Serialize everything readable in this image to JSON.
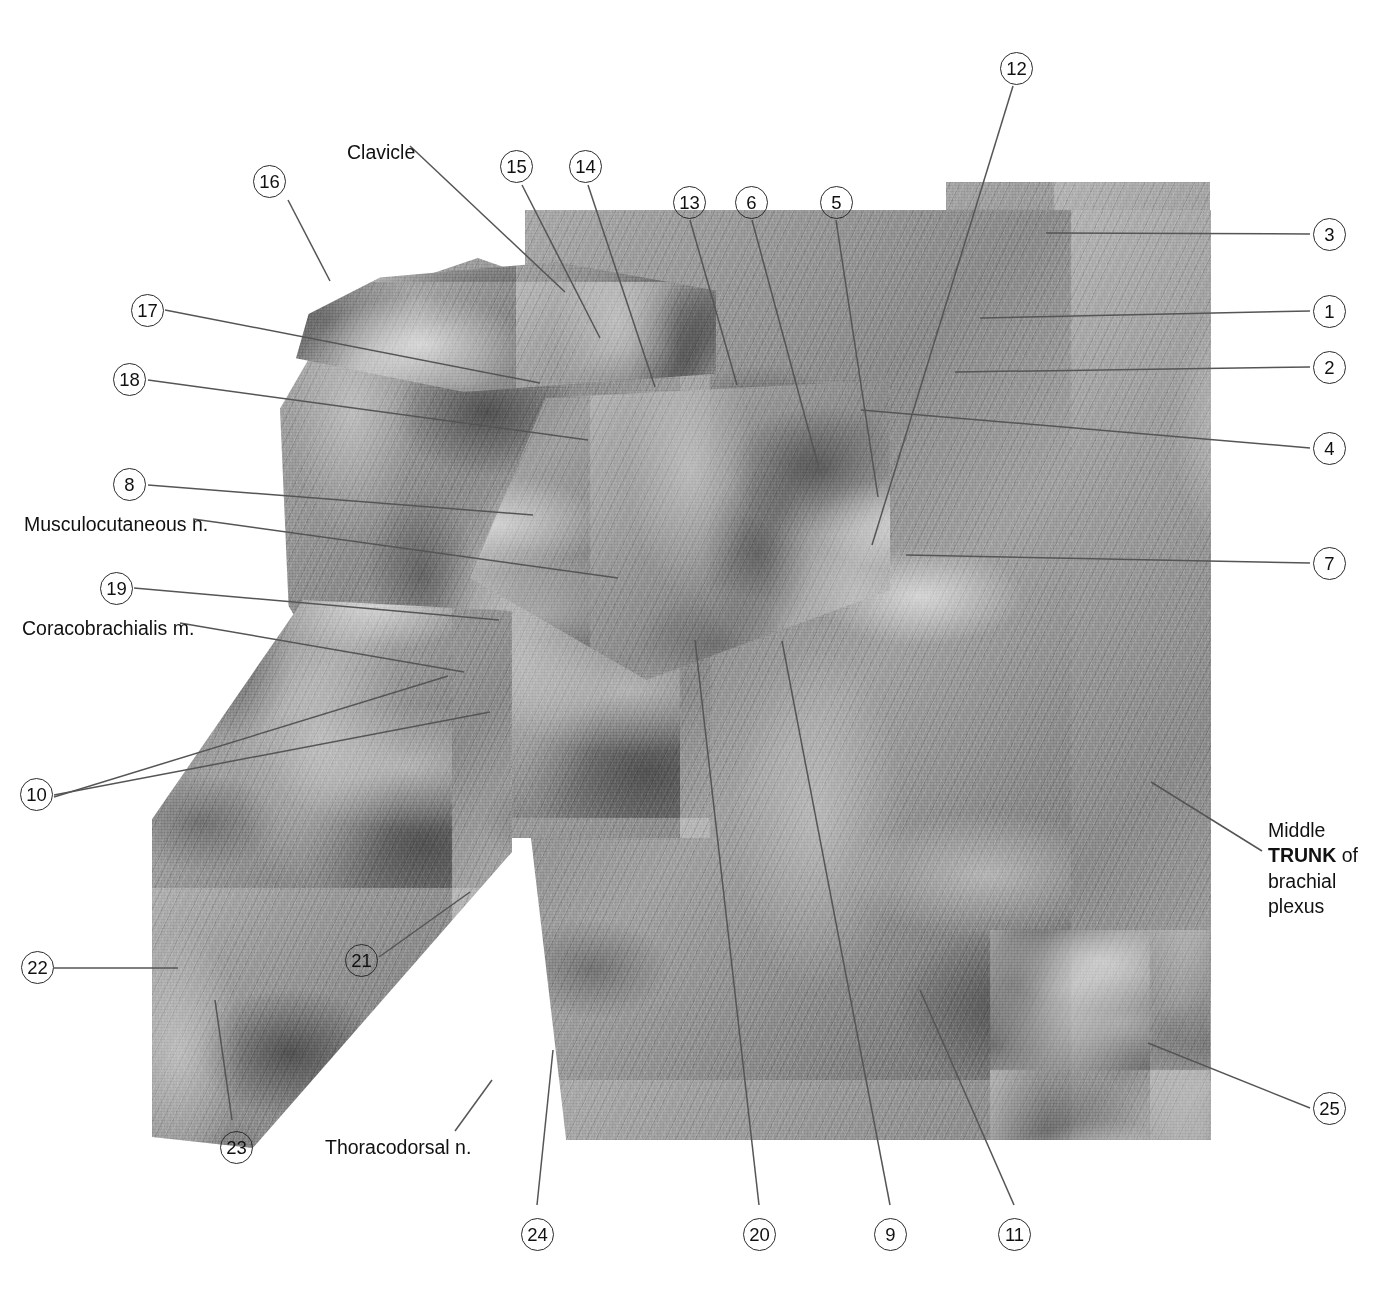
{
  "figure": {
    "type": "anatomical-photograph",
    "color_mode": "grayscale"
  },
  "text_labels": [
    {
      "id": "clavicle",
      "text": "Clavicle",
      "x": 347,
      "y": 141,
      "bold": false
    },
    {
      "id": "musculocutaneous",
      "text": "Musculocutaneous n.",
      "x": 24,
      "y": 513,
      "bold": false
    },
    {
      "id": "coracobrachialis",
      "text": "Coracobrachialis m.",
      "x": 22,
      "y": 617,
      "bold": false
    },
    {
      "id": "thoracodorsal",
      "text": "Thoracodorsal n.",
      "x": 325,
      "y": 1136,
      "bold": false
    }
  ],
  "multiline_labels": [
    {
      "id": "middle-trunk",
      "x": 1268,
      "y": 818,
      "lines": [
        {
          "text": "Middle",
          "bold": false
        },
        {
          "text": "TRUNK",
          "bold": true,
          "suffix": " of"
        },
        {
          "text": "brachial",
          "bold": false
        },
        {
          "text": "plexus",
          "bold": false
        }
      ]
    }
  ],
  "numbered_labels": [
    {
      "n": "12",
      "x": 1000,
      "y": 52,
      "group": "top"
    },
    {
      "n": "16",
      "x": 253,
      "y": 165,
      "group": "left"
    },
    {
      "n": "15",
      "x": 500,
      "y": 150,
      "group": "top"
    },
    {
      "n": "14",
      "x": 569,
      "y": 150,
      "group": "top"
    },
    {
      "n": "13",
      "x": 673,
      "y": 186,
      "group": "top"
    },
    {
      "n": "6",
      "x": 735,
      "y": 186,
      "group": "top"
    },
    {
      "n": "5",
      "x": 820,
      "y": 186,
      "group": "top"
    },
    {
      "n": "3",
      "x": 1313,
      "y": 218,
      "group": "right"
    },
    {
      "n": "1",
      "x": 1313,
      "y": 295,
      "group": "right"
    },
    {
      "n": "2",
      "x": 1313,
      "y": 351,
      "group": "right"
    },
    {
      "n": "4",
      "x": 1313,
      "y": 432,
      "group": "right"
    },
    {
      "n": "7",
      "x": 1313,
      "y": 547,
      "group": "right"
    },
    {
      "n": "17",
      "x": 131,
      "y": 294,
      "group": "left"
    },
    {
      "n": "18",
      "x": 113,
      "y": 363,
      "group": "left"
    },
    {
      "n": "8",
      "x": 113,
      "y": 468,
      "group": "left"
    },
    {
      "n": "19",
      "x": 100,
      "y": 572,
      "group": "left"
    },
    {
      "n": "10",
      "x": 20,
      "y": 778,
      "group": "left"
    },
    {
      "n": "22",
      "x": 21,
      "y": 951,
      "group": "left"
    },
    {
      "n": "23",
      "x": 220,
      "y": 1131,
      "group": "bottom"
    },
    {
      "n": "21",
      "x": 345,
      "y": 944,
      "group": "left"
    },
    {
      "n": "25",
      "x": 1313,
      "y": 1092,
      "group": "right"
    },
    {
      "n": "24",
      "x": 521,
      "y": 1218,
      "group": "bottom"
    },
    {
      "n": "20",
      "x": 743,
      "y": 1218,
      "group": "bottom"
    },
    {
      "n": "9",
      "x": 874,
      "y": 1218,
      "group": "bottom"
    },
    {
      "n": "11",
      "x": 998,
      "y": 1218,
      "group": "bottom"
    }
  ],
  "leader_lines": [
    {
      "for": "16",
      "points": "288,200 330,281"
    },
    {
      "for": "clavicle",
      "points": "410,146 565,292"
    },
    {
      "for": "15",
      "points": "522,185 600,338"
    },
    {
      "for": "14",
      "points": "588,185 655,387"
    },
    {
      "for": "13",
      "points": "690,220 737,385"
    },
    {
      "for": "6",
      "points": "752,220 818,465"
    },
    {
      "for": "5",
      "points": "836,220 878,497"
    },
    {
      "for": "12",
      "points": "1013,86 872,545"
    },
    {
      "for": "3",
      "points": "1310,234 1046,233"
    },
    {
      "for": "1",
      "points": "1310,311 980,318"
    },
    {
      "for": "2",
      "points": "1310,367 955,372"
    },
    {
      "for": "4",
      "points": "1310,448 861,410"
    },
    {
      "for": "7",
      "points": "1310,563 906,555"
    },
    {
      "for": "17",
      "points": "165,310 540,383"
    },
    {
      "for": "18",
      "points": "148,380 588,440"
    },
    {
      "for": "8",
      "points": "148,485 533,515"
    },
    {
      "for": "musculocutaneous",
      "points": "193,519 618,578"
    },
    {
      "for": "19",
      "points": "134,588 499,620"
    },
    {
      "for": "coracobrachialis",
      "points": "180,623 464,672"
    },
    {
      "for": "10a",
      "points": "54,795 490,712"
    },
    {
      "for": "10b",
      "points": "54,797 448,676"
    },
    {
      "for": "22",
      "points": "54,968 178,968"
    },
    {
      "for": "23",
      "points": "232,1120 215,1000"
    },
    {
      "for": "21",
      "points": "379,957 470,892"
    },
    {
      "for": "thoracodorsal",
      "points": "455,1131 492,1080"
    },
    {
      "for": "25",
      "points": "1310,1108 1148,1043"
    },
    {
      "for": "middle-trunk",
      "points": "1262,851 1151,782"
    },
    {
      "for": "24",
      "points": "537,1205 553,1050"
    },
    {
      "for": "20",
      "points": "759,1205 695,640"
    },
    {
      "for": "9",
      "points": "890,1205 782,641"
    },
    {
      "for": "11",
      "points": "1014,1205 920,990"
    }
  ],
  "photo_regions": [
    {
      "id": "upper-right",
      "x": 946,
      "y": 182,
      "w": 264,
      "h": 958
    },
    {
      "id": "main-body",
      "x": 525,
      "y": 210,
      "w": 685,
      "h": 930
    },
    {
      "id": "shoulder",
      "x": 280,
      "y": 260,
      "w": 420,
      "h": 560
    },
    {
      "id": "arm",
      "x": 152,
      "y": 600,
      "w": 330,
      "h": 545
    }
  ]
}
